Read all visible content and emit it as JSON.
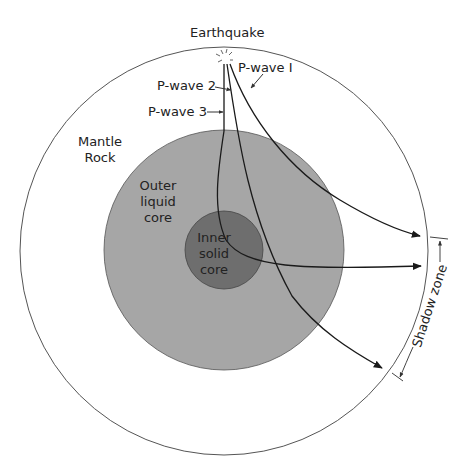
{
  "title": "Earthquake",
  "colors": {
    "background": "#ffffff",
    "mantle_outline": "#555555",
    "outer_core_fill": "#a6a6a6",
    "inner_core_fill": "#6e6e6e",
    "wave_stroke": "#1a1a1a",
    "text": "#222222"
  },
  "layers": {
    "mantle": {
      "label_line1": "Mantle",
      "label_line2": "Rock"
    },
    "outer_core": {
      "label_line1": "Outer",
      "label_line2": "liquid",
      "label_line3": "core"
    },
    "inner_core": {
      "label_line1": "Inner",
      "label_line2": "solid",
      "label_line3": "core"
    }
  },
  "waves": [
    {
      "id": "p1",
      "label": "P-wave I"
    },
    {
      "id": "p2",
      "label": "P-wave 2"
    },
    {
      "id": "p3",
      "label": "P-wave 3"
    }
  ],
  "shadow_zone": {
    "label": "Shadow zone"
  },
  "epicenter_icon": "burst-icon"
}
